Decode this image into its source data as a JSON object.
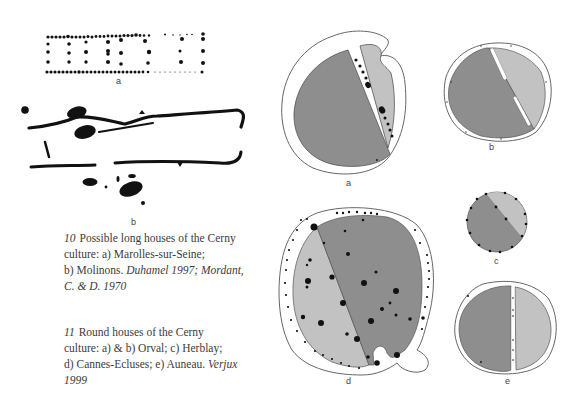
{
  "figures": {
    "fig10": {
      "panel_a_label": "a",
      "panel_b_label": "b"
    },
    "fig11": {
      "panel_a_label": "a",
      "panel_b_label": "b",
      "panel_c_label": "c",
      "panel_d_label": "d",
      "panel_e_label": "e"
    }
  },
  "captions": {
    "fig10": {
      "number": "10",
      "line1": "Possible long houses of the Cerny",
      "line2": "culture: a) Marolles-sur-Seine;",
      "line3_plain": "b) Molinons. ",
      "line3_italic": "Duhamel 1997; Mordant,",
      "line4_italic": "C. & D. 1970"
    },
    "fig11": {
      "number": "11",
      "line1": "Round houses of the Cerny",
      "line2": "culture: a) & b) Orval; c) Herblay;",
      "line3_plain": "d) Cannes-Ecluses; e) Auneau. ",
      "line3_italic": "Verjux",
      "line4_italic": "1999"
    }
  },
  "colors": {
    "dark_fill": "#8e8e8e",
    "light_fill": "#c2c2c2",
    "outline": "#555555",
    "ink": "#111111"
  }
}
